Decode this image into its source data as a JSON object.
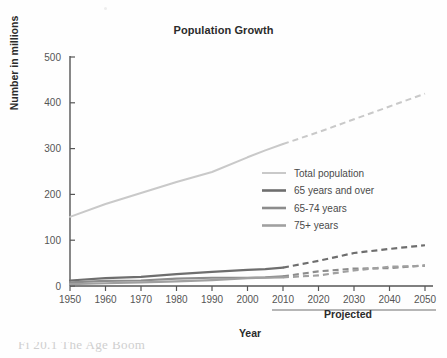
{
  "figure": {
    "title": "Population Growth",
    "caption_partial": "Fi      20.1    The Age Boom",
    "projected_label": "Projected",
    "speck_name": "page-speck"
  },
  "chart_data": {
    "type": "line",
    "title": "Population Growth",
    "xlabel": "Year",
    "ylabel": "Number in millions",
    "xlim": [
      1950,
      2050
    ],
    "ylim": [
      0,
      500
    ],
    "grid": false,
    "legend_position": "center-right",
    "x_ticks": [
      "1950",
      "1960",
      "1970",
      "1980",
      "1990",
      "2000",
      "2010",
      "2020",
      "2030",
      "2040",
      "2050"
    ],
    "y_ticks": [
      "0",
      "100",
      "200",
      "300",
      "400",
      "500"
    ],
    "x": [
      1950,
      1960,
      1970,
      1980,
      1990,
      2000,
      2005,
      2010,
      2020,
      2030,
      2040,
      2050
    ],
    "projection_start_year": 2010,
    "annotations": [
      {
        "text": "Projected",
        "spans_years": [
          2010,
          2050
        ]
      }
    ],
    "series": [
      {
        "name": "Total population",
        "color": "#c9c9c9",
        "values": [
          151,
          179,
          203,
          227,
          249,
          281,
          296,
          310,
          336,
          364,
          392,
          420
        ]
      },
      {
        "name": "65 years and over",
        "color": "#6e6e6e",
        "values": [
          12,
          17,
          20,
          26,
          31,
          35,
          37,
          40,
          55,
          72,
          81,
          89
        ]
      },
      {
        "name": "65-74 years",
        "color": "#8c8c8c",
        "values": [
          8,
          11,
          12,
          16,
          18,
          18,
          19,
          21,
          32,
          38,
          39,
          45
        ]
      },
      {
        "name": "75+ years",
        "color": "#a0a0a0",
        "values": [
          4,
          6,
          8,
          10,
          13,
          17,
          18,
          19,
          23,
          34,
          42,
          44
        ]
      }
    ]
  },
  "legend": {
    "items": [
      {
        "label": "Total population",
        "color": "#c9c9c9"
      },
      {
        "label": "65 years and over",
        "color": "#6e6e6e"
      },
      {
        "label": "65-74 years",
        "color": "#8c8c8c"
      },
      {
        "label": "75+ years",
        "color": "#a0a0a0"
      }
    ]
  },
  "axes": {
    "y_title": "Number in millions",
    "x_title": "Year"
  }
}
